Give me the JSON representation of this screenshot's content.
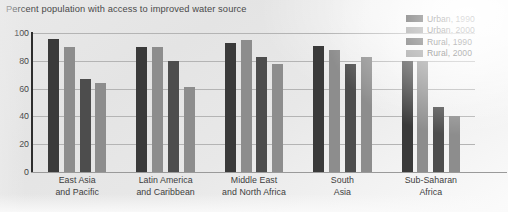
{
  "chart_data": {
    "type": "bar",
    "title": "Percent population with access to improved water source",
    "xlabel": "",
    "ylabel": "",
    "ylim": [
      0,
      100
    ],
    "yticks": [
      0,
      20,
      40,
      60,
      80,
      100
    ],
    "grid": true,
    "legend_position": "top-right",
    "categories": [
      "East Asia and Pacific",
      "Latin America and Caribbean",
      "Middle East and North Africa",
      "South Asia",
      "Sub-Saharan Africa"
    ],
    "category_lines": [
      [
        "East Asia",
        "and Pacific"
      ],
      [
        "Latin America",
        "and Caribbean"
      ],
      [
        "Middle East",
        "and North Africa"
      ],
      [
        "South",
        "Asia"
      ],
      [
        "Sub-Saharan",
        "Africa"
      ]
    ],
    "series": [
      {
        "name": "Urban, 1990",
        "color": "#3a3a3a",
        "values": [
          96,
          90,
          93,
          91,
          80
        ]
      },
      {
        "name": "Urban, 2000",
        "color": "#8d8d8d",
        "values": [
          90,
          90,
          95,
          88,
          80
        ]
      },
      {
        "name": "Rural, 1990",
        "color": "#4d4d4d",
        "values": [
          67,
          80,
          83,
          78,
          47
        ]
      },
      {
        "name": "Rural, 2000",
        "color": "#8d8d8d",
        "values": [
          64,
          61,
          78,
          83,
          40
        ]
      }
    ]
  },
  "axis": {
    "tick_labels": [
      "100",
      "80",
      "60",
      "40",
      "20",
      "0"
    ]
  },
  "colors": {
    "urban_1990": "#3a3a3a",
    "urban_2000": "#8d8d8d",
    "rural_1990": "#4d4d4d",
    "rural_2000": "#8d8d8d",
    "gridline": "#b4b4b4",
    "axis": "#2e2e2e",
    "text": "#3d3d3d",
    "background": "#e8e8e8"
  }
}
